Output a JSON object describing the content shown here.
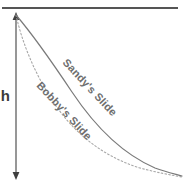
{
  "figure": {
    "background_color": "#ffffff",
    "width": 183,
    "height": 186
  },
  "ceiling": {
    "name": "top-reference-line",
    "color": "#555555",
    "x_start": 2,
    "x_end": 178,
    "y": 8,
    "thickness": 2
  },
  "height_arrow": {
    "label": "h",
    "color": "#555555",
    "x": 16,
    "y_top": 14,
    "y_bottom": 177,
    "label_x": 11,
    "label_y": 101,
    "label_font_size": 15
  },
  "curves": [
    {
      "name": "sandys-slide",
      "label": "Sandy's Slide",
      "style": "solid",
      "color": "#7a7a7a",
      "stroke_width": 1.2,
      "label_x": 62,
      "label_y": 63,
      "label_rotation": 47,
      "label_font_size": 11,
      "path": "M16,15 C34,36 52,62 72,92 C92,122 118,152 155,168 C166,172 175,174 182,176"
    },
    {
      "name": "bobbys-slide",
      "label": "Bobby's Slide",
      "style": "dotted",
      "color": "#a8a8a8",
      "stroke_width": 1.1,
      "dash_pattern": "1.6 2.2",
      "label_x": 36,
      "label_y": 86,
      "label_rotation": 47,
      "label_font_size": 11,
      "path": "M16,15 C22,42 34,72 52,100 C70,128 98,155 140,168 C155,172 170,175 182,177"
    }
  ],
  "colors": {
    "line_dark": "#555555",
    "curve_solid": "#7a7a7a",
    "curve_dotted": "#a8a8a8",
    "text_gray": "#6e6e6e",
    "text_dark": "#3a3a3a",
    "background": "#ffffff"
  }
}
